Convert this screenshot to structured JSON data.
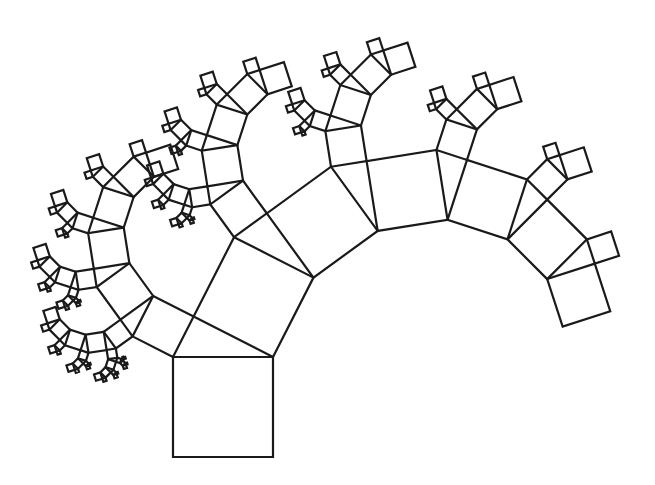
{
  "figure": {
    "type": "pythagoras-tree",
    "stroke_color": "#1a1a1a",
    "background": "#ffffff",
    "base_square": {
      "x0": 173,
      "y0": 357,
      "x1": 273,
      "y1": 357,
      "side": 100
    },
    "angle_degrees": 27,
    "depth": 6
  }
}
